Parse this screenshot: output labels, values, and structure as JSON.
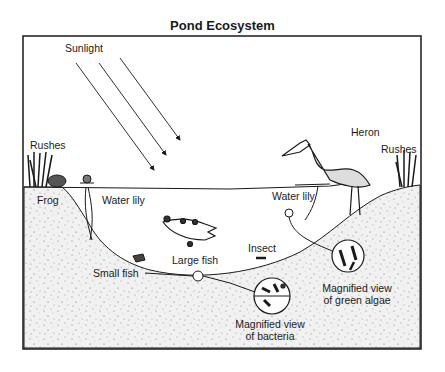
{
  "title": "Pond Ecosystem",
  "labels": {
    "sunlight": "Sunlight",
    "rushes_left": "Rushes",
    "rushes_right": "Rushes",
    "heron": "Heron",
    "frog": "Frog",
    "water_lily_left": "Water lily",
    "water_lily_right": "Water lily",
    "insect": "Insect",
    "large_fish": "Large fish",
    "small_fish": "Small fish",
    "algae_line1": "Magnified view",
    "algae_line2": "of green algae",
    "bacteria_line1": "Magnified view",
    "bacteria_line2": "of bacteria"
  },
  "colors": {
    "ink": "#1a1a1a",
    "sediment": "#ececec",
    "water": "#ffffff"
  }
}
